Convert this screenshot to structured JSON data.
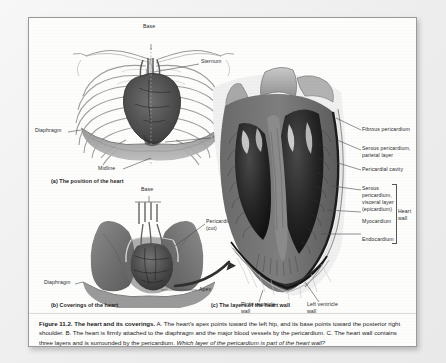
{
  "figure": {
    "number": "Figure 11.2.",
    "title": "The heart and its coverings.",
    "body_a": "A. The heart's apex points toward the left hip, and its base points toward the posterior right shoulder.",
    "body_b": "B. The heart is firmly attached to the diaphragm and the major blood vessels by the pericardium.",
    "body_c": "C. The heart wall contains three layers and is surrounded by the pericardium.",
    "question": "Which layer of the pericardium is part of the heart wall?"
  },
  "panel_a": {
    "caption": "(a) The position of the heart",
    "labels": {
      "base": "Base",
      "sternum": "Sternum",
      "diaphragm": "Diaphragm",
      "apex": "Apex",
      "midline": "Midline"
    }
  },
  "panel_b": {
    "caption": "(b) Coverings of the heart",
    "labels": {
      "base": "Base",
      "pericardium_line1": "Pericardium",
      "pericardium_line2": "(cut)",
      "diaphragm": "Diaphragm",
      "apex": "Apex"
    }
  },
  "panel_c": {
    "caption": "(c) The layers of the heart wall",
    "labels": {
      "fibrous_pericardium": "Fibrous pericardium",
      "serous_parietal_line1": "Serous pericardium,",
      "serous_parietal_line2": "parietal layer",
      "pericardial_cavity": "Pericardial cavity",
      "serous_visceral_line1": "Serous",
      "serous_visceral_line2": "pericardium,",
      "serous_visceral_line3": "visceral layer",
      "serous_visceral_line4": "(epicardium)",
      "myocardium": "Myocardium",
      "endocardium": "Endocardium",
      "heart_wall_line1": "Heart",
      "heart_wall_line2": "wall",
      "right_ventricle_line1": "Right ventricle",
      "right_ventricle_line2": "wall",
      "left_ventricle_line1": "Left ventricle",
      "left_ventricle_line2": "wall"
    }
  },
  "colors": {
    "page_background": "#fdfdfc",
    "outer_background": "#f2f2f2",
    "text": "#1c1c1c",
    "leader_line": "#4a4a4a",
    "heart_muscle": "#8a8a8a",
    "lung_tissue": "#9d9d9d"
  }
}
